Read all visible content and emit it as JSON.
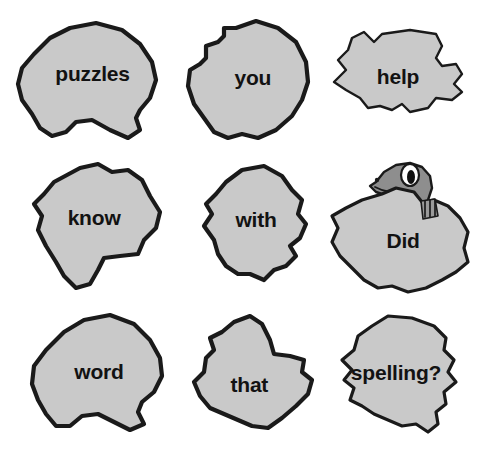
{
  "page": {
    "background_color": "#ffffff",
    "blob_fill_color": "#c9c9c9",
    "blob_stroke_color": "#1a1a1a",
    "gecko_color": "#8e8e8e",
    "text_color": "#121212"
  },
  "sentence": "Did you know that with help puzzles word spelling?",
  "blobs": [
    {
      "id": "puzzles",
      "label": "puzzles",
      "row": 1,
      "col": 1,
      "font_size": "21px"
    },
    {
      "id": "you",
      "label": "you",
      "row": 1,
      "col": 2,
      "font_size": "21px"
    },
    {
      "id": "help",
      "label": "help",
      "row": 1,
      "col": 3,
      "font_size": "21px"
    },
    {
      "id": "know",
      "label": "know",
      "row": 2,
      "col": 1,
      "font_size": "21px"
    },
    {
      "id": "with",
      "label": "with",
      "row": 2,
      "col": 2,
      "font_size": "21px"
    },
    {
      "id": "did",
      "label": "Did",
      "row": 2,
      "col": 3,
      "font_size": "21px"
    },
    {
      "id": "word",
      "label": "word",
      "row": 3,
      "col": 1,
      "font_size": "21px"
    },
    {
      "id": "that",
      "label": "that",
      "row": 3,
      "col": 2,
      "font_size": "21px"
    },
    {
      "id": "spelling",
      "label": "spelling?",
      "row": 3,
      "col": 3,
      "font_size": "21px"
    }
  ],
  "gecko": {
    "name": "gecko-character",
    "description": "grey gecko peeking over the Did blob",
    "eye_color": "#ffffff",
    "pupil_color": "#111111"
  }
}
